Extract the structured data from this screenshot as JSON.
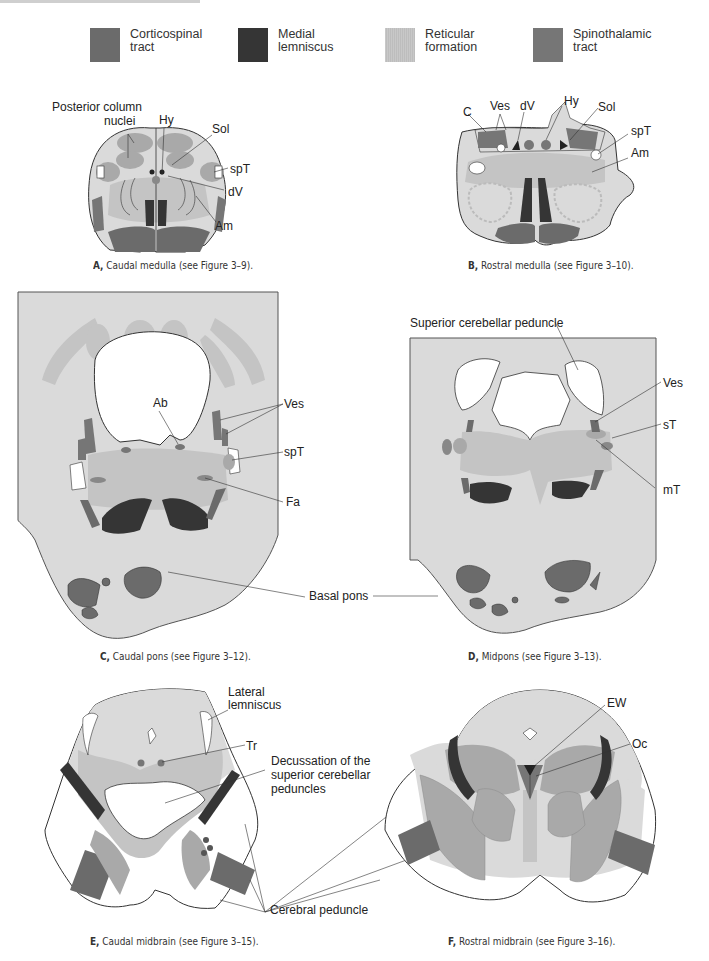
{
  "colors": {
    "corticospinal": "#6b6b6b",
    "medial_lemniscus": "#353535",
    "reticular": "#c4c4c4",
    "spinothalamic": "#767676",
    "background_tissue": "#dadada",
    "nucleus": "#a9a9a9",
    "outline": "#333333"
  },
  "legend": [
    {
      "id": "corticospinal",
      "line1": "Corticospinal",
      "line2": "tract"
    },
    {
      "id": "medial-lemniscus",
      "line1": "Medial",
      "line2": "lemniscus"
    },
    {
      "id": "reticular",
      "line1": "Reticular",
      "line2": "formation"
    },
    {
      "id": "spinothalamic",
      "line1": "Spinothalamic",
      "line2": "tract"
    }
  ],
  "panels": {
    "A": {
      "letter": "A,",
      "caption": "Caudal medulla (see Figure 3–9).",
      "labels": {
        "pcn1": "Posterior column",
        "pcn2": "nuclei",
        "hy": "Hy",
        "sol": "Sol",
        "spt": "spT",
        "dv": "dV",
        "am": "Am"
      }
    },
    "B": {
      "letter": "B,",
      "caption": "Rostral medulla (see Figure 3–10).",
      "labels": {
        "c": "C",
        "ves": "Ves",
        "dv": "dV",
        "hy": "Hy",
        "sol": "Sol",
        "spt": "spT",
        "am": "Am"
      }
    },
    "C": {
      "letter": "C,",
      "caption": "Caudal pons (see Figure 3–12).",
      "labels": {
        "ab": "Ab",
        "ves": "Ves",
        "spt": "spT",
        "fa": "Fa"
      }
    },
    "D": {
      "letter": "D,",
      "caption": "Midpons (see Figure 3–13).",
      "labels": {
        "scp": "Superior cerebellar peduncle",
        "ves": "Ves",
        "st": "sT",
        "mt": "mT"
      }
    },
    "shared": {
      "basal_pons": "Basal pons",
      "cerebral_peduncle": "Cerebral peduncle"
    },
    "E": {
      "letter": "E,",
      "caption": "Caudal midbrain (see Figure 3–15).",
      "labels": {
        "ll1": "Lateral",
        "ll2": "lemniscus",
        "tr": "Tr",
        "dec1": "Decussation of the",
        "dec2": "superior cerebellar",
        "dec3": "peduncles"
      }
    },
    "F": {
      "letter": "F,",
      "caption": "Rostral midbrain (see Figure 3–16).",
      "labels": {
        "ew": "EW",
        "oc": "Oc"
      }
    }
  }
}
